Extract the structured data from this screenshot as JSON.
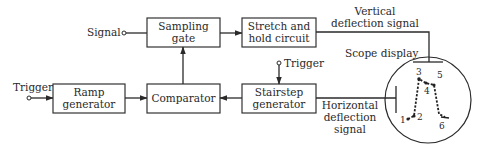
{
  "blocks": {
    "sampling_gate": [
      "Sampling",
      "gate"
    ],
    "stretch_hold": [
      "Stretch and",
      "hold circuit"
    ],
    "ramp_generator": [
      "Ramp",
      "generator"
    ],
    "comparator": [
      "Comparator"
    ],
    "stairstep_generator": [
      "Stairstep",
      "generator"
    ]
  },
  "labels": {
    "signal_input": "Signal",
    "trigger_left": "Trigger",
    "trigger_stairstep": "Trigger",
    "vertical_deflection": [
      "Vertical",
      "deflection signal"
    ],
    "horizontal_deflection": [
      "Horizontal",
      "deflection",
      "signal"
    ],
    "scope_display": "Scope display"
  },
  "scope_points": [
    "1",
    "2",
    "3",
    "4",
    "5",
    "6"
  ]
}
